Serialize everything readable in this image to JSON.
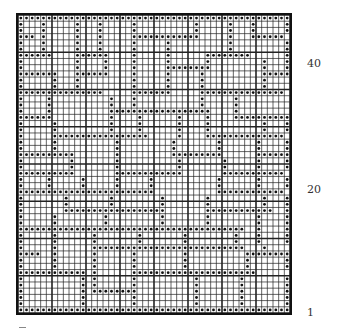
{
  "chart_data": {
    "type": "table",
    "title": "",
    "cols": 48,
    "rows": 48,
    "major_every": 6,
    "row_labels": [
      {
        "row": 40,
        "label": "40"
      },
      {
        "row": 20,
        "label": "20"
      },
      {
        "row": 1,
        "label": "1"
      }
    ],
    "pattern_top_to_bottom": [
      "oooooooooooooooooooooooooooooooooooooooooooooooo",
      "o...o.....o...o.....o..........o.....o...o.....o",
      "o...o.....o...o.....o..........o.....o...o.....o",
      "ooo.o.....o...o.....oooooooooooo.....o...oooooo",
      "o...o.....o...o.....o.....o..........o.........o",
      "o...o.....o...o.....o.....o..........o.........o",
      "oooooo....oooooo....o.....o......oooooooo......o",
      "o.........o....o....o.....o......o.........o...o",
      "o.........o....o....o.....oooooooo.........o...o",
      "ooooooo...oooooo....o.....o.....o..........oooooo",
      "o.....o...o.........o.....o.....o..........o....o",
      "o.....o...o.........o.....o.....o..........o....o",
      "ooooooooooooooo.....ooooooo.....ooooooooooooooo",
      "o....o..........o...o...........o.....o.........o",
      "o....o..........o...o...........o.....o.........o",
      "o....o..........oooooooooooooooooo....o.........o",
      "oooooo..........o....o......o....o....oooooooooo",
      "o.....o.........o....o......o....o.........o...o",
      "o.....o.........o....o......o....o.........o...o",
      "o.....ooooooooooooooooo.....o....oooooooooooooo",
      "o.....o..........o.........o.......o......o....o",
      "o.....o..........o.........o.......o......o....o",
      "oooooooooo.......o.........ooooooooo......oooooo",
      "o........o.......o..........o.......o.....o....o",
      "o........o.......o..........o.......o.....o....o",
      "oooooooooo.......oooooooooooo.......ooooooooooo",
      "o....o.....o.....o.....o...........o......o....o",
      "o....o.....o.....o.....o...........o......o....o",
      "oooooooooooooooooooooooo...........oooooooooooo",
      "o.......o.......o........o.......o.........o...o",
      "o.......o.......o........o.......o.........o...o",
      "o.......oooooooooooooooooo.......oooooooooooo..o",
      "o.....o........o.........o.......o........o....o",
      "o.....o........o.........o.......o........o....o",
      "oooooooooooooooooooooooooooooooooooooooo..o....o",
      "o.....o......o.......o.......o........o...o....o",
      "o.....o......o.......o.......o........o...o....o",
      "o.....o......ooooooooooooooooooooooooooo...o....o",
      "oooo..o......o......o........o..........oooooooo",
      "o.....o......o......o........o..........o......o",
      "o.....o......o......o........o..........o......o",
      "oooooooooooo.o......oooooooooooooooooooooo......o",
      "o..........o.o......o..........o.......o.......o",
      "o..........o.o......o..........o.......o.......o",
      "o..........o.oooooooo..........o.......o.......o",
      "o..........o........o..........o.......o.......o",
      "o..........o........o..........o.......o.......o",
      "oooooooooooooooooooooooooooooooooooooooooooooooo"
    ]
  },
  "labels": {
    "row40": "40",
    "row20": "20",
    "row1": "1"
  }
}
